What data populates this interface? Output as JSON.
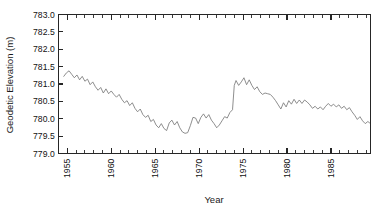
{
  "chart_data": {
    "type": "line",
    "title": "",
    "xlabel": "Year",
    "ylabel": "Geodetic Elevation (m)",
    "xlim": [
      1954.0,
      1989.5
    ],
    "ylim": [
      779.0,
      783.0
    ],
    "grid": false,
    "legend": null,
    "x_major_ticks": [
      1955,
      1960,
      1965,
      1970,
      1975,
      1980,
      1985
    ],
    "x_major_tick_labels": [
      "1955",
      "1960",
      "1965",
      "1970",
      "1975",
      "1980",
      "1985"
    ],
    "x_minor_tick_interval": 1,
    "y_major_ticks": [
      779.0,
      779.5,
      780.0,
      780.5,
      781.0,
      781.5,
      782.0,
      782.5,
      783.0
    ],
    "y_major_tick_labels": [
      "779.0",
      "779.5",
      "780.0",
      "780.5",
      "781.0",
      "781.5",
      "782.0",
      "782.5",
      "783.0"
    ],
    "series_name": "Geodetic Elevation",
    "series_color": "#7a7a7a",
    "x": [
      1954.6,
      1954.9,
      1955.2,
      1955.5,
      1955.8,
      1956.1,
      1956.4,
      1956.7,
      1957.0,
      1957.3,
      1957.6,
      1957.9,
      1958.2,
      1958.5,
      1958.8,
      1959.1,
      1959.4,
      1959.7,
      1960.0,
      1960.3,
      1960.6,
      1960.9,
      1961.2,
      1961.5,
      1961.8,
      1962.1,
      1962.4,
      1962.7,
      1963.0,
      1963.3,
      1963.6,
      1963.9,
      1964.2,
      1964.5,
      1964.8,
      1965.1,
      1965.4,
      1965.7,
      1966.0,
      1966.3,
      1966.6,
      1966.9,
      1967.2,
      1967.5,
      1967.8,
      1968.1,
      1968.4,
      1968.7,
      1969.0,
      1969.3,
      1969.6,
      1969.9,
      1970.2,
      1970.5,
      1970.8,
      1971.1,
      1971.4,
      1971.7,
      1972.0,
      1972.3,
      1972.6,
      1972.9,
      1973.2,
      1973.5,
      1973.8,
      1974.0,
      1974.2,
      1974.5,
      1974.8,
      1975.1,
      1975.4,
      1975.7,
      1976.0,
      1976.3,
      1976.6,
      1976.9,
      1977.2,
      1977.5,
      1977.8,
      1978.1,
      1978.4,
      1978.7,
      1979.0,
      1979.3,
      1979.6,
      1979.9,
      1980.2,
      1980.5,
      1980.8,
      1981.1,
      1981.4,
      1981.7,
      1982.0,
      1982.3,
      1982.6,
      1982.9,
      1983.2,
      1983.5,
      1983.8,
      1984.1,
      1984.4,
      1984.7,
      1985.0,
      1985.3,
      1985.6,
      1985.9,
      1986.2,
      1986.5,
      1986.8,
      1987.1,
      1987.4,
      1987.7,
      1988.0,
      1988.3,
      1988.6,
      1988.9,
      1989.2,
      1989.4
    ],
    "y": [
      781.22,
      781.32,
      781.38,
      781.28,
      781.18,
      781.26,
      781.12,
      781.22,
      781.08,
      781.14,
      780.98,
      781.06,
      780.92,
      780.82,
      780.9,
      780.74,
      780.86,
      780.72,
      780.8,
      780.7,
      780.62,
      780.7,
      780.56,
      780.46,
      780.52,
      780.38,
      780.46,
      780.3,
      780.2,
      780.28,
      780.12,
      780.04,
      780.1,
      779.92,
      779.98,
      779.82,
      779.74,
      779.86,
      779.72,
      779.66,
      779.88,
      779.96,
      779.82,
      779.92,
      779.74,
      779.62,
      779.58,
      779.6,
      779.8,
      780.04,
      780.02,
      779.86,
      780.04,
      780.14,
      780.02,
      780.12,
      779.96,
      779.86,
      779.74,
      779.82,
      779.94,
      780.06,
      780.02,
      780.18,
      780.26,
      780.96,
      781.1,
      780.96,
      781.06,
      781.18,
      780.98,
      781.12,
      780.96,
      780.84,
      780.92,
      780.78,
      780.7,
      780.74,
      780.72,
      780.7,
      780.62,
      780.52,
      780.4,
      780.28,
      780.46,
      780.34,
      780.52,
      780.42,
      780.56,
      780.44,
      780.54,
      780.44,
      780.54,
      780.48,
      780.4,
      780.3,
      780.36,
      780.28,
      780.34,
      780.26,
      780.36,
      780.44,
      780.36,
      780.42,
      780.34,
      780.4,
      780.3,
      780.36,
      780.26,
      780.32,
      780.2,
      780.1,
      779.98,
      780.06,
      779.94,
      779.86,
      779.92,
      779.88
    ]
  }
}
